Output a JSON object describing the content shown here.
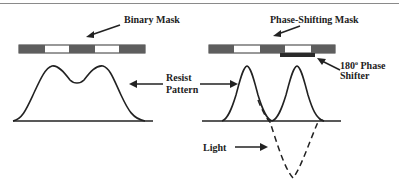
{
  "labels": {
    "binary_mask": "Binary Mask",
    "phase_shifting_mask": "Phase-Shifting Mask",
    "resist_line1": "Resist",
    "resist_line2": "Pattern",
    "phase_shifter_line1": "180",
    "phase_shifter_deg": "o",
    "phase_shifter_line1b": " Phase",
    "phase_shifter_line2": "Shifter",
    "light": "Light"
  },
  "colors": {
    "mask_opaque": "#5e5e5e",
    "mask_clear": "#ffffff",
    "shifter": "#2a2a2a",
    "line": "#222222"
  }
}
